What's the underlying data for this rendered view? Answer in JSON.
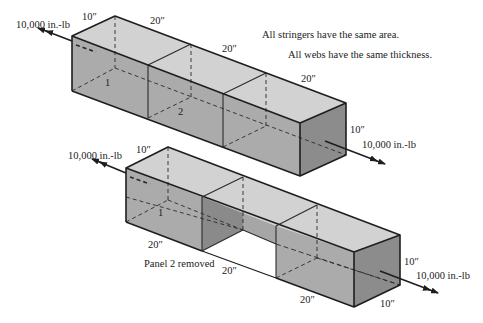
{
  "notes": {
    "stringers": "All stringers have the same area.",
    "webs": "All webs have the same thickness."
  },
  "colors": {
    "top_face": "#d2d2d2",
    "front_face": "#ababab",
    "end_face": "#8c8c8c",
    "inner_dark": "#8a8a8a",
    "edge": "#1e1e1e",
    "background": "#ffffff"
  },
  "top_box": {
    "moment_left": "10,000 in.-lb",
    "moment_right": "10,000 in.-lb",
    "dim_width_left": "10″",
    "dim_bay1": "20″",
    "dim_bay2": "20″",
    "dim_bay3": "20″",
    "dim_height_right": "10″",
    "section_labels": [
      "1",
      "2"
    ]
  },
  "bottom_box": {
    "moment_left": "10,000 in.-lb",
    "moment_right": "10,000 in.-lb",
    "dim_width_left": "10″",
    "dim_bay1": "20″",
    "dim_bay2": "20″",
    "dim_bay3": "20″",
    "dim_height_right": "10″",
    "dim_depth_right": "10″",
    "section_labels": [
      "1"
    ],
    "caption": "Panel 2 removed"
  }
}
